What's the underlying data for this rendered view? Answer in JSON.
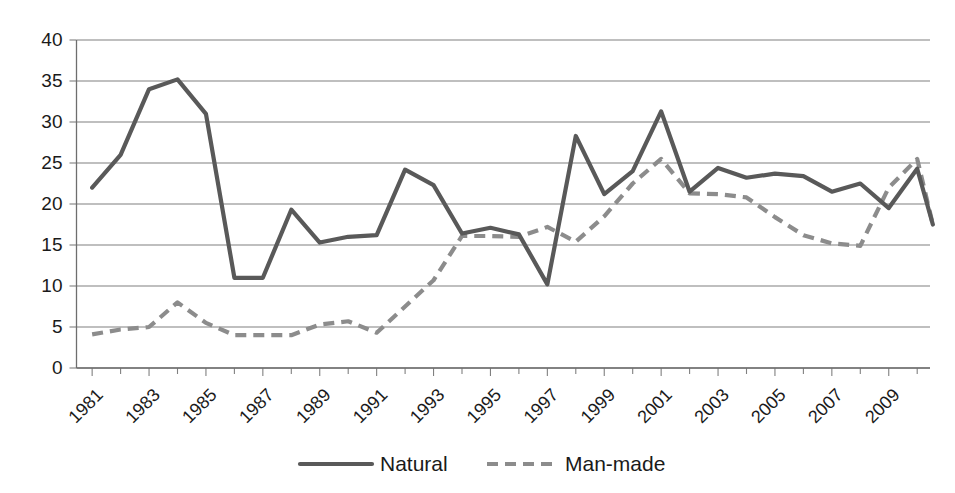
{
  "chart_data": {
    "type": "line",
    "title": "",
    "subtitle": "",
    "xlabel": "",
    "ylabel": "",
    "ylim": [
      0,
      40
    ],
    "xlim": [
      1981,
      2010
    ],
    "y_ticks": [
      0,
      5,
      10,
      15,
      20,
      25,
      30,
      35,
      40
    ],
    "x_tick_labels": [
      "1981",
      "1983",
      "1985",
      "1987",
      "1989",
      "1991",
      "1993",
      "1995",
      "1997",
      "1999",
      "2001",
      "2003",
      "2005",
      "2007",
      "2009"
    ],
    "grid": "horizontal",
    "legend_position": "bottom-center",
    "x": [
      1981,
      1982,
      1983,
      1984,
      1985,
      1986,
      1987,
      1988,
      1989,
      1990,
      1991,
      1992,
      1993,
      1994,
      1995,
      1996,
      1997,
      1998,
      1999,
      2000,
      2001,
      2002,
      2003,
      2004,
      2005,
      2006,
      2007,
      2008,
      2009,
      2010
    ],
    "series": [
      {
        "name": "Natural",
        "style": "solid",
        "color": "#595959",
        "values": [
          22.0,
          26.0,
          34.0,
          35.2,
          31.0,
          11.0,
          11.0,
          19.3,
          15.3,
          16.0,
          16.2,
          24.2,
          22.3,
          16.4,
          17.1,
          16.3,
          10.2,
          28.3,
          21.2,
          24.0,
          31.3,
          21.5,
          24.4,
          23.2,
          23.7,
          23.4,
          21.5,
          22.5,
          19.5,
          24.3
        ]
      },
      {
        "name": "Man-made",
        "style": "dashed",
        "color": "#8c8c8c",
        "values": [
          4.1,
          4.7,
          5.0,
          8.0,
          5.5,
          4.0,
          4.0,
          4.0,
          5.3,
          5.7,
          4.3,
          7.5,
          10.7,
          16.1,
          16.1,
          16.0,
          17.2,
          15.4,
          18.5,
          22.5,
          25.5,
          21.3,
          21.2,
          20.8,
          18.4,
          16.2,
          15.2,
          14.9,
          22.0,
          25.5
        ]
      }
    ],
    "series_endpoints": {
      "natural_final": 17.5,
      "manmade_final": 17.5
    }
  },
  "legend": {
    "items": [
      {
        "label": "Natural",
        "style": "solid"
      },
      {
        "label": "Man-made",
        "style": "dashed"
      }
    ]
  }
}
